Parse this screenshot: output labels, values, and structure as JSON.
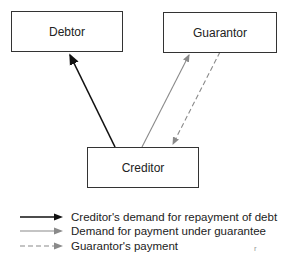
{
  "boxes": {
    "debtor": "Debtor",
    "guarantor": "Guarantor",
    "creditor": "Creditor"
  },
  "legend": [
    {
      "label": "Creditor's demand for repayment of debt",
      "style": "solid",
      "color": "#111111"
    },
    {
      "label": "Demand for payment under guarantee",
      "style": "solid",
      "color": "#8a8a8a"
    },
    {
      "label": "Guarantor's payment",
      "style": "dashed",
      "color": "#8a8a8a"
    }
  ],
  "stray_mark": "r"
}
